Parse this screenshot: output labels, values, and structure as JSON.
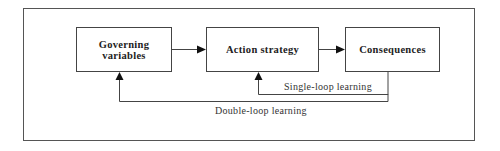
{
  "diagram": {
    "nodes": [
      {
        "id": "governing",
        "label_line1": "Governing",
        "label_line2": "variables"
      },
      {
        "id": "action",
        "label": "Action strategy"
      },
      {
        "id": "consequences",
        "label": "Consequences"
      }
    ],
    "edges": [
      {
        "from": "governing",
        "to": "action",
        "type": "forward"
      },
      {
        "from": "action",
        "to": "consequences",
        "type": "forward"
      },
      {
        "from": "consequences",
        "to": "action",
        "type": "feedback",
        "label": "Single-loop learning"
      },
      {
        "from": "consequences",
        "to": "governing",
        "type": "feedback",
        "label": "Double-loop learning"
      }
    ],
    "labels": {
      "single_loop": "Single-loop learning",
      "double_loop": "Double-loop learning"
    },
    "colors": {
      "line": "#444444",
      "text": "#222222",
      "background": "#ffffff"
    }
  }
}
